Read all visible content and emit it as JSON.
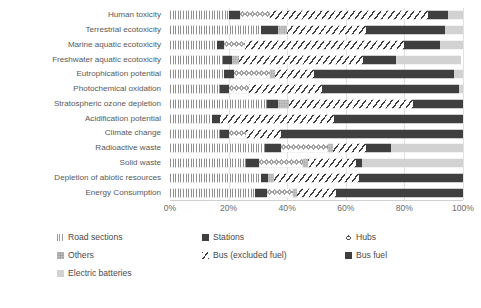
{
  "chart_data": {
    "type": "bar",
    "orientation": "horizontal",
    "stacked": true,
    "normalized": true,
    "title": "",
    "xlabel": "",
    "ylabel": "",
    "xlim": [
      0,
      100
    ],
    "xticks": [
      "0%",
      "20%",
      "40%",
      "60%",
      "80%",
      "100%"
    ],
    "xtick_values": [
      0,
      20,
      40,
      60,
      80,
      100
    ],
    "grid": true,
    "legend_position": "bottom",
    "categories": [
      "Human toxicity",
      "Terrestrial ecotoxicity",
      "Marine aquatic ecotoxicity",
      "Freshwater aquatic ecotoxicity",
      "Eutrophication potential",
      "Photochemical oxidation",
      "Stratospheric ozone depletion",
      "Acidification potential",
      "Climate change",
      "Radioactive waste",
      "Solid waste",
      "Depletion of abiotic resources",
      "Energy Consumption"
    ],
    "series": [
      {
        "name": "Road sections",
        "pattern": "road",
        "values": [
          20.0,
          31.0,
          16.0,
          18.0,
          18.5,
          17.0,
          33.0,
          14.5,
          17.0,
          32.5,
          26.0,
          31.0,
          29.0
        ]
      },
      {
        "name": "Stations",
        "pattern": "stations",
        "values": [
          4.0,
          6.0,
          2.5,
          3.0,
          3.5,
          3.0,
          4.0,
          2.5,
          3.0,
          5.5,
          4.5,
          2.5,
          4.0
        ]
      },
      {
        "name": "Hubs",
        "pattern": "hubs",
        "values": [
          10.0,
          0.0,
          7.0,
          0.0,
          12.0,
          7.0,
          0.0,
          0.0,
          6.0,
          16.0,
          15.0,
          0.0,
          9.0
        ]
      },
      {
        "name": "Others",
        "pattern": "others",
        "values": [
          0.0,
          3.0,
          0.0,
          2.5,
          2.0,
          0.0,
          3.5,
          0.0,
          0.0,
          1.5,
          1.5,
          2.0,
          1.5
        ]
      },
      {
        "name": "Bus (excluded fuel)",
        "pattern": "busx",
        "values": [
          54.0,
          27.0,
          54.5,
          42.5,
          13.0,
          25.0,
          42.5,
          39.0,
          12.0,
          11.5,
          16.5,
          29.0,
          13.0
        ]
      },
      {
        "name": "Bus fuel",
        "pattern": "busfuel",
        "values": [
          7.0,
          27.0,
          12.0,
          11.0,
          48.0,
          46.5,
          17.0,
          44.0,
          62.0,
          8.5,
          2.0,
          35.5,
          43.5
        ]
      },
      {
        "name": "Electric batteries",
        "pattern": "batt",
        "values": [
          5.0,
          6.0,
          8.0,
          22.5,
          3.0,
          1.5,
          0.0,
          0.0,
          0.0,
          24.5,
          34.5,
          0.0,
          0.0
        ]
      }
    ]
  },
  "legend": {
    "items": [
      {
        "label": "Road sections",
        "pattern": "road"
      },
      {
        "label": "Stations",
        "pattern": "stations"
      },
      {
        "label": "Hubs",
        "pattern": "hubs"
      },
      {
        "label": "Others",
        "pattern": "others"
      },
      {
        "label": "Bus (excluded fuel)",
        "pattern": "busx"
      },
      {
        "label": "Bus fuel",
        "pattern": "busfuel"
      },
      {
        "label": "Electric batteries",
        "pattern": "batt"
      }
    ]
  },
  "caption": ""
}
